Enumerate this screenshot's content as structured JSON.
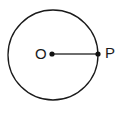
{
  "figure": {
    "type": "circle-with-radius-diagram",
    "background_color": "#ffffff",
    "width": 123,
    "height": 115,
    "circle": {
      "name": "circle-outline",
      "center_x": 53,
      "center_y": 55,
      "radius": 45,
      "stroke_color": "#1a1a1a",
      "stroke_width": 1.3,
      "fill": "none"
    },
    "radius_segment": {
      "name": "radius-segment-OP",
      "from_x": 52,
      "from_y": 54,
      "to_x": 98,
      "to_y": 54,
      "stroke_color": "#6e6e6e",
      "stroke_width": 2
    },
    "points": [
      {
        "id": "center",
        "label": "O",
        "dot_x": 52,
        "dot_y": 54,
        "dot_radius": 2.6,
        "dot_color": "#111111",
        "label_position": "left"
      },
      {
        "id": "on-circle",
        "label": "P",
        "dot_x": 98,
        "dot_y": 54,
        "dot_radius": 2.6,
        "dot_color": "#111111",
        "label_position": "right"
      }
    ]
  }
}
